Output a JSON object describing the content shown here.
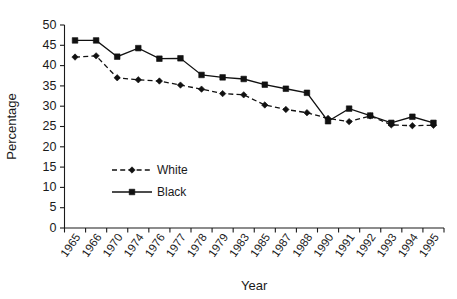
{
  "chart_data": {
    "type": "line",
    "title": "",
    "subtitle": "",
    "xlabel": "Year",
    "ylabel": "Percentage",
    "ylim": [
      0,
      50
    ],
    "ytick_step": 5,
    "yticks": [
      0,
      5,
      10,
      15,
      20,
      25,
      30,
      35,
      40,
      45,
      50
    ],
    "grid": false,
    "legend_position": "inside-lower-left",
    "categories": [
      "1965",
      "1966",
      "1970",
      "1974",
      "1976",
      "1977",
      "1978",
      "1979",
      "1983",
      "1985",
      "1987",
      "1988",
      "1990",
      "1991",
      "1992",
      "1993",
      "1994",
      "1995"
    ],
    "series": [
      {
        "name": "White",
        "line_style": "dashed",
        "marker": "diamond",
        "color": "#111111",
        "values": [
          42.1,
          42.4,
          37.0,
          36.5,
          36.2,
          35.2,
          34.2,
          33.1,
          32.8,
          30.3,
          29.2,
          28.4,
          27.0,
          26.2,
          27.6,
          25.4,
          25.2,
          25.3
        ]
      },
      {
        "name": "Black",
        "line_style": "solid",
        "marker": "square",
        "color": "#111111",
        "values": [
          46.2,
          46.2,
          42.2,
          44.3,
          41.7,
          41.8,
          37.7,
          37.1,
          36.7,
          35.3,
          34.3,
          33.3,
          26.3,
          29.4,
          27.7,
          25.9,
          27.4,
          25.9
        ]
      }
    ],
    "legend": [
      {
        "label": "White",
        "marker": "diamond",
        "line_style": "dashed"
      },
      {
        "label": "Black",
        "marker": "square",
        "line_style": "solid"
      }
    ]
  },
  "axis": {
    "ylabel": "Percentage",
    "xlabel": "Year"
  }
}
